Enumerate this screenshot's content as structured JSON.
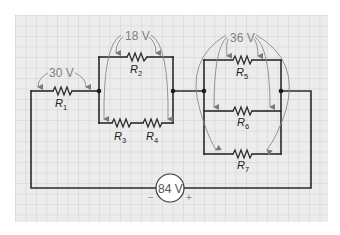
{
  "diagram": {
    "type": "series-parallel circuit",
    "background": "graph-paper grid",
    "colors": {
      "grid_bg": "#ececec",
      "grid_line": "#c8c8c8",
      "wire": "#2a2a2a",
      "voltage_arrow": "#8a8a8a",
      "voltage_label": "#808080"
    },
    "source": {
      "label": "84 V",
      "negative_sign": "−",
      "positive_sign": "+"
    },
    "voltage_labels": {
      "r1_drop": "30 V",
      "block2_drop": "18 V",
      "block3_drop": "36 V"
    },
    "resistors": {
      "r1": {
        "letter": "R",
        "sub": "1"
      },
      "r2": {
        "letter": "R",
        "sub": "2"
      },
      "r3": {
        "letter": "R",
        "sub": "3"
      },
      "r4": {
        "letter": "R",
        "sub": "4"
      },
      "r5": {
        "letter": "R",
        "sub": "5"
      },
      "r6": {
        "letter": "R",
        "sub": "6"
      },
      "r7": {
        "letter": "R",
        "sub": "7"
      }
    }
  }
}
